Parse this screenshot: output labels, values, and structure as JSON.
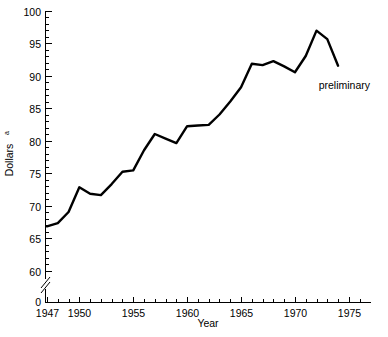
{
  "chart_data": {
    "type": "line",
    "title": "",
    "xlabel": "Year",
    "ylabel": "Dollars",
    "ylabel_superscript": "a",
    "xlim": [
      1947,
      1976
    ],
    "ylim": [
      58,
      100
    ],
    "y_axis_break": true,
    "y_zero_label": "0",
    "grid": false,
    "legend": "none",
    "annotations": [
      {
        "text": "preliminary",
        "x": 1972.2,
        "y": 88.0
      }
    ],
    "x_major_ticks": [
      1947,
      1950,
      1955,
      1960,
      1965,
      1970,
      1975
    ],
    "x_major_tick_labels": [
      "1947",
      "1950",
      "1955",
      "1960",
      "1965",
      "1970",
      "1975"
    ],
    "x_minor_ticks": [
      1948,
      1949,
      1951,
      1952,
      1953,
      1954,
      1956,
      1957,
      1958,
      1959,
      1961,
      1962,
      1963,
      1964,
      1966,
      1967,
      1968,
      1969,
      1971,
      1972,
      1973,
      1974,
      1976
    ],
    "y_major_ticks": [
      60,
      65,
      70,
      75,
      80,
      85,
      90,
      95,
      100
    ],
    "y_major_tick_labels": [
      "60",
      "65",
      "70",
      "75",
      "80",
      "85",
      "90",
      "95",
      "100"
    ],
    "y_minor_ticks": [
      61,
      62,
      63,
      64,
      66,
      67,
      68,
      69,
      71,
      72,
      73,
      74,
      76,
      77,
      78,
      79,
      81,
      82,
      83,
      84,
      86,
      87,
      88,
      89,
      91,
      92,
      93,
      94,
      96,
      97,
      98,
      99
    ],
    "x": [
      1947,
      1948,
      1949,
      1950,
      1951,
      1952,
      1953,
      1954,
      1955,
      1956,
      1957,
      1958,
      1959,
      1960,
      1961,
      1962,
      1963,
      1964,
      1965,
      1966,
      1967,
      1968,
      1969,
      1970,
      1971,
      1972,
      1973,
      1974
    ],
    "values": [
      66.8,
      67.3,
      69.0,
      72.8,
      71.8,
      71.6,
      73.3,
      75.2,
      75.4,
      78.5,
      81.0,
      80.3,
      79.6,
      82.2,
      82.3,
      82.4,
      84.0,
      86.0,
      88.2,
      91.8,
      91.6,
      92.2,
      91.4,
      90.5,
      93.0,
      96.9,
      95.6,
      91.5
    ],
    "series_name": "Dollars",
    "line_color": "#000000",
    "line_width": 2.4
  },
  "axis": {
    "x_title": "Year",
    "y_title": "Dollars",
    "y_title_superscript": "a"
  }
}
